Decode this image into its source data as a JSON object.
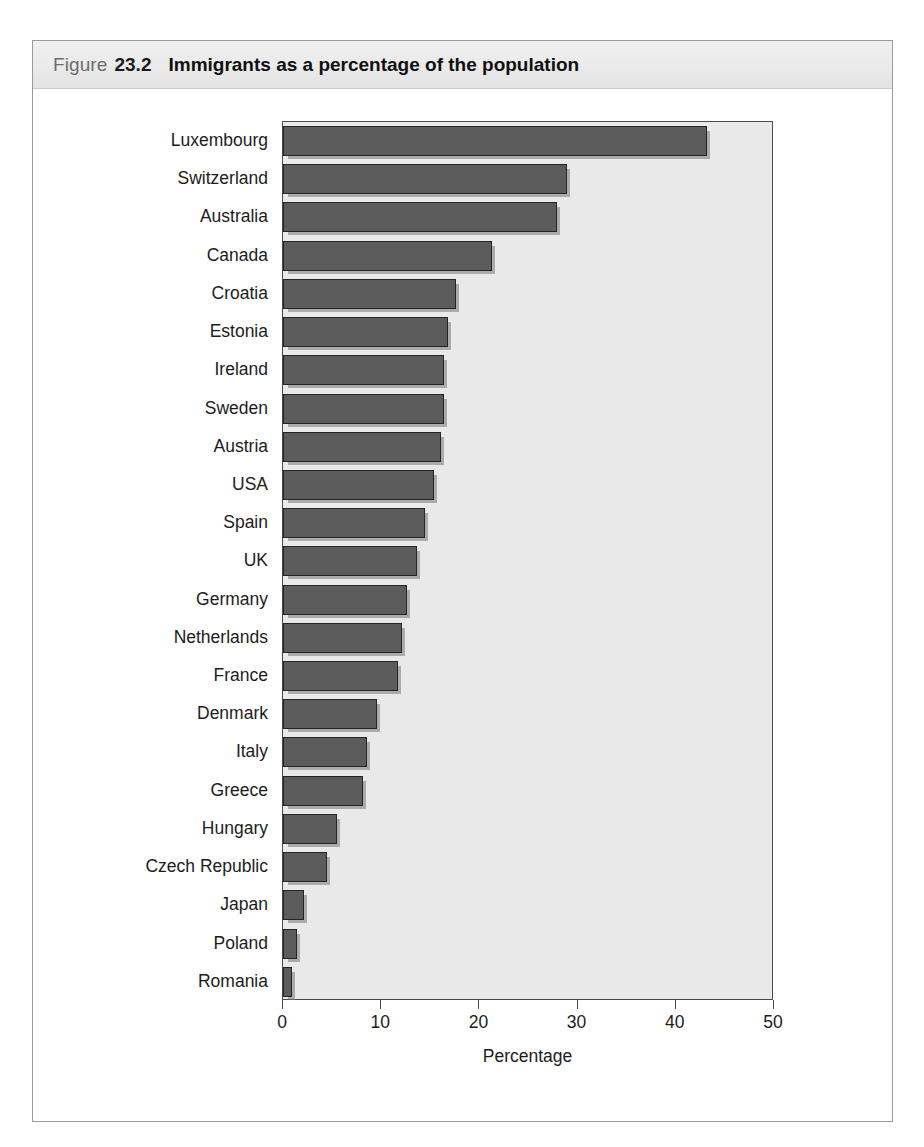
{
  "figure": {
    "label_word": "Figure",
    "number": "23.2",
    "title": "Immigrants as a percentage of the population"
  },
  "colors": {
    "bar_fill": "#5c5c5c",
    "bar_border": "#242424",
    "plot_background": "#e9e9e9",
    "header_band": "#eaeaea",
    "frame_border": "#9a9a9a",
    "text": "#1c1c1c"
  },
  "chart_data": {
    "type": "bar",
    "orientation": "horizontal",
    "title": "Immigrants as a percentage of the population",
    "xlabel": "Percentage",
    "ylabel": "",
    "xlim": [
      0,
      50
    ],
    "xticks": [
      0,
      10,
      20,
      30,
      40,
      50
    ],
    "xtick_labels": [
      "0",
      "10",
      "20",
      "30",
      "40",
      "50"
    ],
    "grid": false,
    "legend": false,
    "categories": [
      "Luxembourg",
      "Switzerland",
      "Australia",
      "Canada",
      "Croatia",
      "Estonia",
      "Ireland",
      "Sweden",
      "Austria",
      "USA",
      "Spain",
      "UK",
      "Germany",
      "Netherlands",
      "France",
      "Denmark",
      "Italy",
      "Greece",
      "Hungary",
      "Czech Republic",
      "Japan",
      "Poland",
      "Romania"
    ],
    "values": [
      43.2,
      28.9,
      27.9,
      21.3,
      17.6,
      16.8,
      16.4,
      16.4,
      16.1,
      15.4,
      14.5,
      13.6,
      12.6,
      12.1,
      11.7,
      9.6,
      8.6,
      8.1,
      5.5,
      4.5,
      2.1,
      1.4,
      0.9
    ]
  }
}
